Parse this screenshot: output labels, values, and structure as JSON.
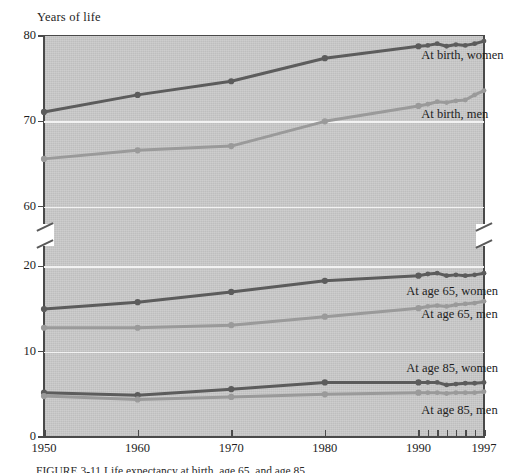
{
  "figure": {
    "axis_title": "Years of life",
    "caption_partial": "FIGURE 3-11   Life expectancy at birth, age 65, and age 85"
  },
  "chart_data": {
    "type": "line",
    "title": "",
    "xlabel": "",
    "ylabel": "Years of life",
    "grid": true,
    "legend_position": "inline-right",
    "axis_break": true,
    "x": [
      1950,
      1960,
      1970,
      1980,
      1990,
      1991,
      1992,
      1993,
      1994,
      1995,
      1996,
      1997
    ],
    "xticks_major": [
      "1950",
      "1960",
      "1970",
      "1980",
      "1990",
      "1997"
    ],
    "xticks_minor": [
      1990,
      1991,
      1992,
      1993,
      1994,
      1995,
      1996,
      1997
    ],
    "y_upper": {
      "ticks": [
        60,
        70,
        80
      ],
      "ylim": [
        57.5,
        80
      ]
    },
    "y_lower": {
      "ticks": [
        0,
        10,
        20
      ],
      "ylim": [
        0,
        22.5
      ]
    },
    "series": [
      {
        "name": "At birth, women",
        "panel": "upper",
        "color": "#5c5c5c",
        "values": [
          71.1,
          73.1,
          74.7,
          77.4,
          78.8,
          78.9,
          79.1,
          78.8,
          79.0,
          78.9,
          79.1,
          79.4
        ]
      },
      {
        "name": "At birth, men",
        "panel": "upper",
        "color": "#9a9a9a",
        "values": [
          65.6,
          66.6,
          67.1,
          70.0,
          71.8,
          72.0,
          72.3,
          72.2,
          72.4,
          72.5,
          73.1,
          73.6
        ]
      },
      {
        "name": "At age 65, women",
        "panel": "lower",
        "color": "#5c5c5c",
        "values": [
          15.0,
          15.8,
          17.0,
          18.3,
          18.9,
          19.1,
          19.2,
          18.9,
          19.0,
          18.9,
          19.0,
          19.2
        ]
      },
      {
        "name": "At age 65, men",
        "panel": "lower",
        "color": "#9a9a9a",
        "values": [
          12.8,
          12.8,
          13.1,
          14.1,
          15.1,
          15.3,
          15.4,
          15.3,
          15.5,
          15.6,
          15.7,
          15.9
        ]
      },
      {
        "name": "At age 85, women",
        "panel": "lower",
        "color": "#5c5c5c",
        "values": [
          5.2,
          4.9,
          5.6,
          6.4,
          6.4,
          6.4,
          6.4,
          6.1,
          6.2,
          6.3,
          6.3,
          6.4
        ]
      },
      {
        "name": "At age 85, men",
        "panel": "lower",
        "color": "#9a9a9a",
        "values": [
          4.8,
          4.4,
          4.7,
          5.0,
          5.2,
          5.2,
          5.2,
          5.1,
          5.2,
          5.2,
          5.2,
          5.3
        ]
      }
    ],
    "annotations": [
      {
        "text": "At birth, women",
        "x": 1990.3,
        "y": 77.6,
        "panel": "upper"
      },
      {
        "text": "At birth, men",
        "x": 1990.3,
        "y": 70.7,
        "panel": "upper"
      },
      {
        "text": "At age 65, women",
        "x": 1988.7,
        "y": 17.0,
        "panel": "lower"
      },
      {
        "text": "At age 65, men",
        "x": 1990.3,
        "y": 14.3,
        "panel": "lower"
      },
      {
        "text": "At age 85, women",
        "x": 1988.7,
        "y": 8.0,
        "panel": "lower"
      },
      {
        "text": "At age 85, men",
        "x": 1990.3,
        "y": 3.1,
        "panel": "lower"
      }
    ]
  },
  "ytick_labels_upper": [
    "80",
    "70",
    "60"
  ],
  "ytick_labels_lower": [
    "20",
    "10",
    "0"
  ],
  "xtick_labels": [
    "1950",
    "1960",
    "1970",
    "1980",
    "1990",
    "1997"
  ]
}
